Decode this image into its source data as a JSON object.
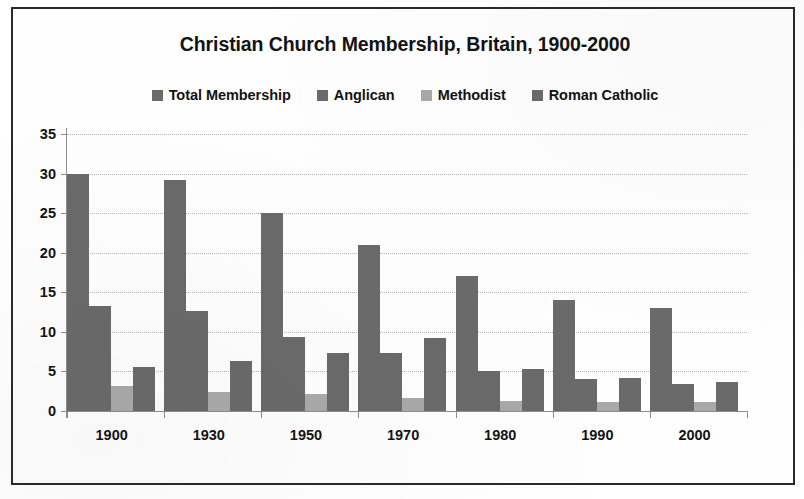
{
  "chart_data": {
    "type": "bar",
    "title": "Christian Church Membership, Britain, 1900-2000",
    "xlabel": "",
    "ylabel": "",
    "categories": [
      "1900",
      "1930",
      "1950",
      "1970",
      "1980",
      "1990",
      "2000"
    ],
    "series": [
      {
        "name": "Total Membership",
        "color": "#6a6a6a",
        "values": [
          30.0,
          29.2,
          25.0,
          21.0,
          17.0,
          14.0,
          13.0
        ]
      },
      {
        "name": "Anglican",
        "color": "#6a6a6a",
        "values": [
          13.3,
          12.7,
          9.3,
          7.3,
          5.0,
          4.0,
          3.4
        ]
      },
      {
        "name": "Methodist",
        "color": "#a9a9a9",
        "values": [
          3.1,
          2.4,
          2.1,
          1.6,
          1.3,
          1.1,
          1.1
        ]
      },
      {
        "name": "Roman Catholic",
        "color": "#6a6a6a",
        "values": [
          5.6,
          6.3,
          7.3,
          9.2,
          5.3,
          4.2,
          3.7
        ]
      }
    ],
    "yticks": [
      0,
      5,
      10,
      15,
      20,
      25,
      30,
      35
    ],
    "ylim": [
      0,
      35
    ],
    "grid": true,
    "legend_position": "top"
  },
  "legend": {
    "items": [
      {
        "label": "Total Membership",
        "swatch": "legend-swatch-total-membership",
        "color": "#6a6a6a"
      },
      {
        "label": "Anglican",
        "swatch": "legend-swatch-anglican",
        "color": "#6a6a6a"
      },
      {
        "label": "Methodist",
        "swatch": "legend-swatch-methodist",
        "color": "#a9a9a9"
      },
      {
        "label": "Roman Catholic",
        "swatch": "legend-swatch-roman-catholic",
        "color": "#6a6a6a"
      }
    ]
  },
  "style": {
    "frame_color": "#2a2a2a",
    "background": "#ffffff",
    "gridline_color": "#b4b4b4",
    "axis_color": "#8d8d8d",
    "text_color": "#131313"
  }
}
